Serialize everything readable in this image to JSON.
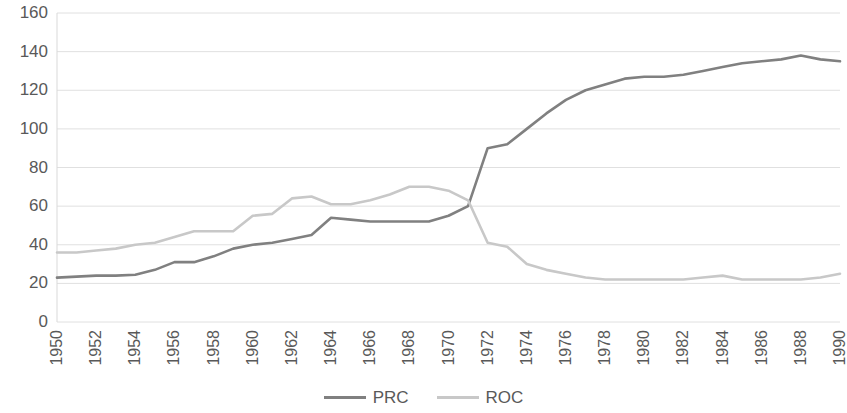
{
  "chart_data": {
    "type": "line",
    "title": "",
    "subtitle": "",
    "xlabel": "",
    "ylabel": "",
    "xlim": [
      1950,
      1990
    ],
    "ylim": [
      0,
      160
    ],
    "grid": true,
    "legend_position": "bottom",
    "ytick_labels": [
      "160",
      "140",
      "120",
      "100",
      "80",
      "60",
      "40",
      "20",
      "0"
    ],
    "ytick_values": [
      160,
      140,
      120,
      100,
      80,
      60,
      40,
      20,
      0
    ],
    "xtick_labels": [
      "1950",
      "1952",
      "1954",
      "1956",
      "1958",
      "1960",
      "1962",
      "1964",
      "1966",
      "1968",
      "1970",
      "1972",
      "1974",
      "1976",
      "1978",
      "1980",
      "1982",
      "1984",
      "1986",
      "1988",
      "1990"
    ],
    "xtick_values": [
      1950,
      1952,
      1954,
      1956,
      1958,
      1960,
      1962,
      1964,
      1966,
      1968,
      1970,
      1972,
      1974,
      1976,
      1978,
      1980,
      1982,
      1984,
      1986,
      1988,
      1990
    ],
    "x": [
      1950,
      1951,
      1952,
      1953,
      1954,
      1955,
      1956,
      1957,
      1958,
      1959,
      1960,
      1961,
      1962,
      1963,
      1964,
      1965,
      1966,
      1967,
      1968,
      1969,
      1970,
      1971,
      1972,
      1973,
      1974,
      1975,
      1976,
      1977,
      1978,
      1979,
      1980,
      1981,
      1982,
      1983,
      1984,
      1985,
      1986,
      1987,
      1988,
      1989,
      1990
    ],
    "series": [
      {
        "name": "PRC",
        "color": "#808080",
        "values": [
          23,
          23.5,
          24,
          24,
          24.5,
          27,
          31,
          31,
          34,
          38,
          40,
          41,
          43,
          45,
          54,
          53,
          52,
          52,
          52,
          52,
          55,
          60,
          90,
          92,
          100,
          108,
          115,
          120,
          123,
          126,
          127,
          127,
          128,
          130,
          132,
          134,
          135,
          136,
          138,
          136,
          135
        ]
      },
      {
        "name": "ROC",
        "color": "#c8c8c8",
        "values": [
          36,
          36,
          37,
          38,
          40,
          41,
          44,
          47,
          47,
          47,
          55,
          56,
          64,
          65,
          61,
          61,
          63,
          66,
          70,
          70,
          68,
          63,
          41,
          39,
          30,
          27,
          25,
          23,
          22,
          22,
          22,
          22,
          22,
          23,
          24,
          22,
          22,
          22,
          22,
          23,
          25
        ]
      }
    ]
  },
  "legend": {
    "items": [
      {
        "label": "PRC",
        "color": "#808080"
      },
      {
        "label": "ROC",
        "color": "#c8c8c8"
      }
    ]
  },
  "colors": {
    "prc_line": "#808080",
    "roc_line": "#c8c8c8",
    "gridline": "#e0e0e0",
    "axis_text": "#595959",
    "background": "#ffffff"
  }
}
